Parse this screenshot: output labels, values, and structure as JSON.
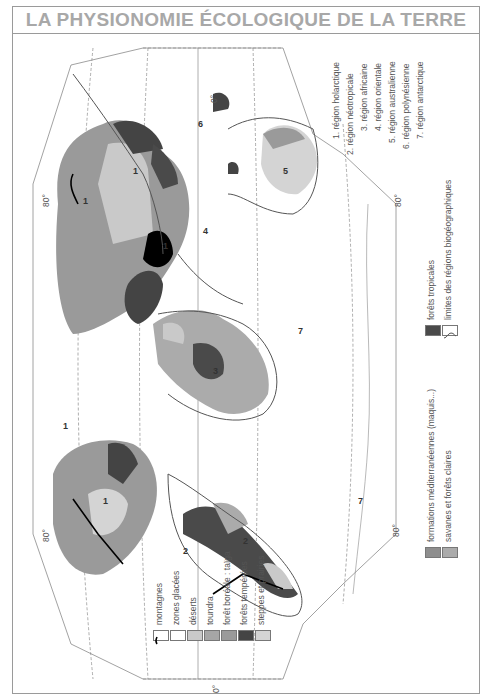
{
  "title": "LA PHYSIONOMIE ÉCOLOGIQUE DE LA TERRE",
  "map": {
    "orientation": "rotated -90deg (landscape world map in portrait frame)",
    "graticule_labels": {
      "lat_top_left": "80°",
      "lat_top_right": "80°",
      "lat_bottom_left": "80°",
      "lat_bottom_right": "80°",
      "meridian_top": "0°",
      "meridian_bottom": "0°"
    },
    "region_numbers_on_map": [
      "1",
      "1",
      "1",
      "1",
      "1",
      "2",
      "2",
      "3",
      "4",
      "5",
      "6",
      "7",
      "7"
    ]
  },
  "legend": {
    "vegetation": [
      {
        "label": "montagnes",
        "swatch": "mountain-line",
        "color": "#ffffff"
      },
      {
        "label": "zones glacées",
        "swatch": "fill",
        "color": "#ffffff"
      },
      {
        "label": "déserts",
        "swatch": "fill",
        "color": "#c9c9c9"
      },
      {
        "label": "toundra",
        "swatch": "fill",
        "color": "#a6a6a6"
      },
      {
        "label": "forêt boréale : taïga",
        "swatch": "fill",
        "color": "#9a9a9a"
      },
      {
        "label": "forêts tempérées",
        "swatch": "fill",
        "color": "#444444"
      },
      {
        "label": "steppes et prairies",
        "swatch": "fill",
        "color": "#d4d4d4"
      },
      {
        "label": "formations méditerranéennes (maquis...)",
        "swatch": "fill",
        "color": "#8e8e8e"
      },
      {
        "label": "savanes et forêts claires",
        "swatch": "fill",
        "color": "#ababab"
      },
      {
        "label": "forêts tropicales",
        "swatch": "fill",
        "color": "#4a4a4a"
      },
      {
        "label": "limites des régions biogéographiques",
        "swatch": "boundary-line",
        "color": "#ffffff"
      }
    ],
    "regions": [
      "1. région holarctique",
      "2. région néotropicale",
      "3. région africaine",
      "4. région orientale",
      "5. région australienne",
      "6. région polynésienne",
      "7. région antarctique"
    ]
  }
}
